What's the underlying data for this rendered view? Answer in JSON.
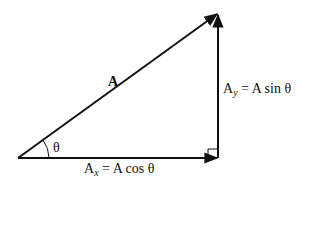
{
  "diagram": {
    "type": "vector-decomposition-right-triangle",
    "vector": {
      "label": "A"
    },
    "angle": {
      "label": "θ"
    },
    "x_component": {
      "base": "A",
      "subscript": "x",
      "equation": "= A cos θ"
    },
    "y_component": {
      "base": "A",
      "subscript": "y",
      "equation": "= A sin θ"
    },
    "right_angle_marker": true,
    "colors": {
      "stroke": "#111111",
      "background": "#ffffff"
    }
  }
}
